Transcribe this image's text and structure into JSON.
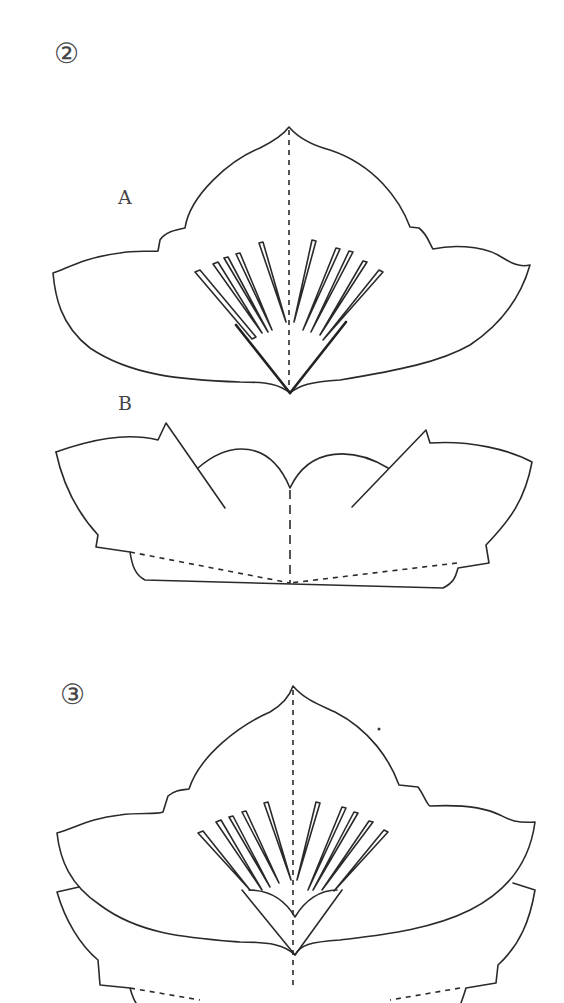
{
  "figure": {
    "step2": {
      "marker": "②",
      "part_a_label": "A",
      "part_b_label": "B"
    },
    "step3": {
      "marker": "③"
    },
    "colors": {
      "line": "#2a2a2a",
      "background": "#ffffff"
    }
  }
}
